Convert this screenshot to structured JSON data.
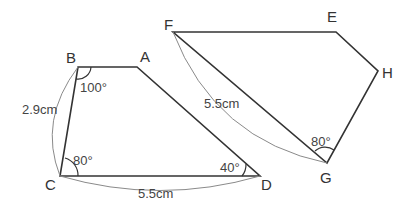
{
  "diagram": {
    "type": "two quadrilaterals (trapezoid ABCD and quadrilateral EFGH)",
    "quad_abcd": {
      "vertices": {
        "A": {
          "label": "A",
          "x": 137,
          "y": 67
        },
        "B": {
          "label": "B",
          "x": 78,
          "y": 67
        },
        "C": {
          "label": "C",
          "x": 60,
          "y": 176
        },
        "D": {
          "label": "D",
          "x": 260,
          "y": 176
        }
      },
      "angles": {
        "B": "100°",
        "C": "80°",
        "D": "40°"
      },
      "lengths": {
        "BC": "2.9cm",
        "CD": "5.5cm"
      }
    },
    "quad_efgh": {
      "vertices": {
        "E": {
          "label": "E",
          "x": 336,
          "y": 32
        },
        "F": {
          "label": "F",
          "x": 173,
          "y": 32
        },
        "G": {
          "label": "G",
          "x": 327,
          "y": 163
        },
        "H": {
          "label": "H",
          "x": 378,
          "y": 71
        }
      },
      "angles": {
        "G": "80°"
      },
      "lengths": {
        "FG": "5.5cm"
      }
    },
    "colors": {
      "line": "#333333",
      "arc": "#8a8a8a",
      "text": "#333333",
      "background": "#ffffff"
    }
  }
}
